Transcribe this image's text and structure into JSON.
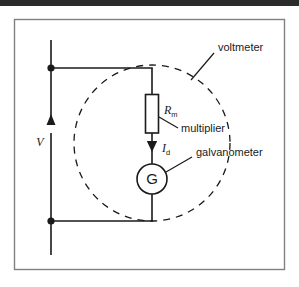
{
  "figure": {
    "kind": "circuit-diagram",
    "border_color": "#808080",
    "line_color": "#1a1a1a",
    "background": "#ffffff"
  },
  "labels": {
    "voltmeter": "voltmeter",
    "multiplier": "multiplier",
    "galvanometer": "galvanometer",
    "galvanometer_symbol": "G",
    "source_voltage": "V",
    "resistor_symbol": "R",
    "resistor_subscript": "m",
    "current_symbol": "I",
    "current_subscript": "d"
  },
  "components": {
    "resistor": {
      "name": "multiplier-resistor",
      "symbol": "R",
      "subscript": "m"
    },
    "meter": {
      "name": "galvanometer",
      "symbol": "G"
    },
    "current": {
      "name": "deflection-current",
      "symbol": "I",
      "subscript": "d",
      "direction": "downward"
    },
    "source": {
      "name": "applied-voltage",
      "symbol": "V",
      "direction": "upward"
    }
  }
}
